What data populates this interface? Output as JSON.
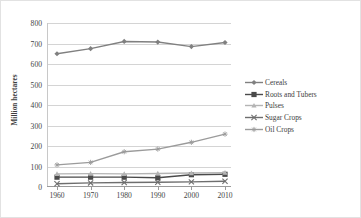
{
  "chart_data": {
    "type": "line",
    "title": "",
    "xlabel": "",
    "ylabel": "Million hectares",
    "categories": [
      "1960",
      "1970",
      "1980",
      "1990",
      "2000",
      "2010"
    ],
    "x": [
      1960,
      1970,
      1980,
      1990,
      2000,
      2010
    ],
    "ylim": [
      0,
      800
    ],
    "yticks": [
      0,
      100,
      200,
      300,
      400,
      500,
      600,
      700,
      800
    ],
    "grid": true,
    "legend_position": "right",
    "series": [
      {
        "name": "Cereals",
        "marker": "diamond",
        "color": "#808080",
        "values": [
          650,
          675,
          710,
          707,
          685,
          705
        ]
      },
      {
        "name": "Roots and Tubers",
        "marker": "square",
        "color": "#4a4a4a",
        "values": [
          48,
          48,
          48,
          45,
          60,
          62
        ]
      },
      {
        "name": "Pulses",
        "marker": "triangle",
        "color": "#b4b4b4",
        "values": [
          64,
          65,
          64,
          66,
          68,
          70
        ]
      },
      {
        "name": "Sugar Crops",
        "marker": "x",
        "color": "#6e6e6e",
        "values": [
          16,
          20,
          22,
          23,
          25,
          28
        ]
      },
      {
        "name": "Oil Crops",
        "marker": "asterisk",
        "color": "#9b9b9b",
        "values": [
          108,
          120,
          172,
          185,
          218,
          258
        ]
      }
    ]
  },
  "axes": {
    "y_title": "Million hectares",
    "y_tick_labels": [
      "800",
      "700",
      "600",
      "500",
      "400",
      "300",
      "200",
      "100",
      "0"
    ],
    "x_tick_labels": [
      "1960",
      "1970",
      "1980",
      "1990",
      "2000",
      "2010"
    ]
  },
  "legend": {
    "items": [
      {
        "label": "Cereals"
      },
      {
        "label": "Roots and Tubers"
      },
      {
        "label": "Pulses"
      },
      {
        "label": "Sugar Crops"
      },
      {
        "label": "Oil Crops"
      }
    ]
  }
}
